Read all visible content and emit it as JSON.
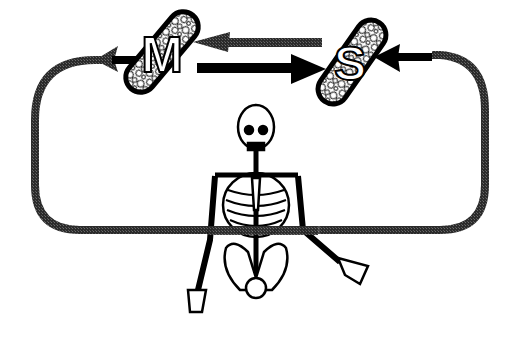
{
  "diagram": {
    "type": "feedback-loop",
    "nodes": [
      {
        "id": "M",
        "label": "M",
        "shape": "pill-textured",
        "icon": "motor-node-icon"
      },
      {
        "id": "S",
        "label": "S",
        "shape": "pill-textured",
        "icon": "sensory-node-icon"
      }
    ],
    "edges": [
      {
        "from": "S",
        "to": "M",
        "style": "gray-arrow",
        "position": "upper"
      },
      {
        "from": "M",
        "to": "S",
        "style": "black-arrow",
        "position": "lower"
      },
      {
        "from": "loop",
        "to": "M",
        "style": "gray-loop-arrowhead",
        "side": "left"
      },
      {
        "from": "loop",
        "to": "S",
        "style": "black-arrowhead",
        "side": "right"
      }
    ],
    "figure": {
      "icon": "skeleton-icon",
      "description": "human skeleton upper body with loop passing through torso"
    },
    "colors": {
      "black": "#000000",
      "gray": "#3a3a3a",
      "background": "#ffffff"
    }
  }
}
